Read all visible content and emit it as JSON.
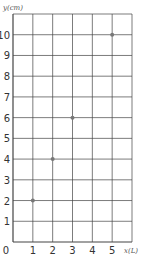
{
  "chart_data": {
    "type": "scatter",
    "title": "",
    "xlabel": "x(L)",
    "ylabel": "y(cm)",
    "x": [
      1,
      2,
      3,
      5
    ],
    "y": [
      2,
      4,
      6,
      10
    ],
    "xlim": [
      0,
      6
    ],
    "ylim": [
      0,
      11
    ],
    "xticks": [
      "0",
      "1",
      "2",
      "3",
      "4",
      "5"
    ],
    "yticks": [
      "1",
      "2",
      "3",
      "4",
      "5",
      "6",
      "7",
      "8",
      "9",
      "10"
    ],
    "grid": true,
    "point_color": "#777777",
    "grid_color": "#444444"
  }
}
